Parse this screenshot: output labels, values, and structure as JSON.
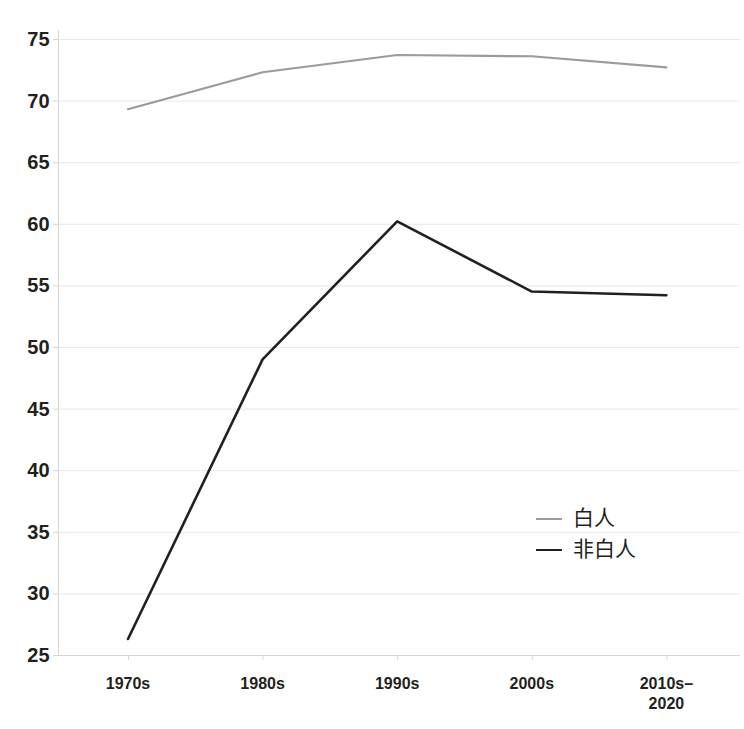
{
  "chart_data": {
    "type": "line",
    "title": "",
    "subtitle": "",
    "xlabel": "",
    "ylabel": "",
    "categories": [
      "1970s",
      "1980s",
      "1990s",
      "2000s",
      "2010s–\n2020"
    ],
    "category_labels_line1": [
      "1970s",
      "1980s",
      "1990s",
      "2000s",
      "2010s–"
    ],
    "category_labels_line2": [
      "",
      "",
      "",
      "",
      "2020"
    ],
    "ylim": [
      25,
      75
    ],
    "ytick_step": 5,
    "yticks": [
      75,
      70,
      65,
      60,
      55,
      50,
      45,
      40,
      35,
      30,
      25
    ],
    "ytick_labels": [
      "75",
      "70",
      "65",
      "60",
      "55",
      "50",
      "45",
      "40",
      "35",
      "30",
      "25"
    ],
    "grid": true,
    "grid_axis": "y",
    "legend_position": "inside-right-middle",
    "series": [
      {
        "name": "白人",
        "color": "#9b9b9b",
        "values": [
          69.3,
          72.3,
          73.7,
          73.6,
          72.7
        ]
      },
      {
        "name": "非白人",
        "color": "#231f20",
        "values": [
          26.3,
          49.0,
          60.2,
          54.5,
          54.2
        ]
      }
    ]
  },
  "legend": {
    "items": [
      {
        "label": "白人",
        "color": "#9b9b9b"
      },
      {
        "label": "非白人",
        "color": "#231f20"
      }
    ]
  },
  "colors": {
    "background": "#ffffff",
    "grid": "#e8e8e8",
    "axis": "#d5d5d5",
    "text": "#231f20",
    "series_white": "#9b9b9b",
    "series_nonwhite": "#231f20"
  }
}
